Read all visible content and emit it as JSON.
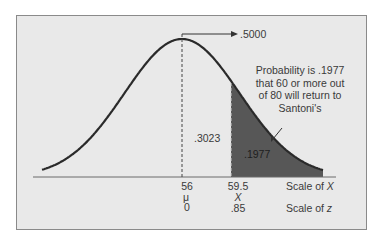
{
  "chart_data": {
    "type": "area",
    "title": "",
    "distribution": {
      "mean": 56,
      "mean_symbol": "μ",
      "z_at_mean": 0
    },
    "cutoff": {
      "x": 59.5,
      "symbol": "X",
      "z": 0.85
    },
    "areas": {
      "right_half": ".5000",
      "mean_to_cutoff": ".3023",
      "right_tail": ".1977"
    },
    "annotation": "Probability is .1977 that 60 or more out of 80 will return to Santoni's",
    "axis_labels": {
      "x_scale": "Scale of X",
      "z_scale": "Scale of z"
    },
    "tick_labels": {
      "x": [
        "56",
        "59.5"
      ],
      "symbols": [
        "μ",
        "X"
      ],
      "z": [
        "0",
        ".85"
      ]
    }
  },
  "labels": {
    "half_area": ".5000",
    "mid_area": ".3023",
    "tail_area": ".1977",
    "note_lines": [
      "Probability is .1977",
      "that 60 or more out",
      "of 80 will return to",
      "Santoni's"
    ],
    "mean_value": "56",
    "mean_symbol": "μ",
    "mean_z": "0",
    "cut_value": "59.5",
    "cut_symbol": "X",
    "cut_z": ".85",
    "scale_x_prefix": "Scale of ",
    "scale_x_var": "X",
    "scale_z_prefix": "Scale of ",
    "scale_z_var": "z"
  },
  "colors": {
    "background": "#e9e9e9",
    "curve": "#2a2a2a",
    "shade": "#575757"
  }
}
